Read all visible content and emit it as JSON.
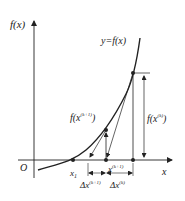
{
  "diagram": {
    "axes": {
      "y_label": "f(x)",
      "x_label": "x",
      "origin_label": "O"
    },
    "curve_label": "y=f(x)",
    "points": {
      "x1": {
        "label": "x",
        "sub": "1"
      },
      "xk1": {
        "label": "x",
        "sup": "(k+1)"
      },
      "fxk1": {
        "label": "f(x",
        "sup": "(k+1)",
        "close": ")"
      },
      "fxk": {
        "label": "f(x",
        "sup": "(k)",
        "close": ")"
      }
    },
    "deltas": {
      "dxk1": {
        "label": "Δx",
        "sup": "(k+1)"
      },
      "dxk": {
        "label": "Δx",
        "sup": "(k)"
      }
    },
    "colors": {
      "stroke": "#222222",
      "background": "#ffffff"
    }
  }
}
